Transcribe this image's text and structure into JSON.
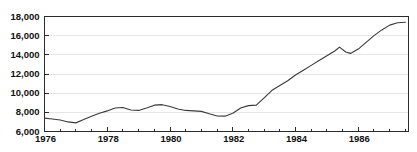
{
  "chart_data": {
    "type": "line",
    "title": "",
    "subtitle": "",
    "xlabel": "",
    "ylabel": "",
    "xlim": [
      1976,
      1987.6
    ],
    "ylim": [
      6000,
      18000
    ],
    "grid": true,
    "legend": null,
    "y_ticks": [
      6000,
      8000,
      10000,
      12000,
      14000,
      16000,
      18000
    ],
    "y_tick_labels": [
      "6,000",
      "8,000",
      "10,000",
      "12,000",
      "14,000",
      "16,000",
      "18,000"
    ],
    "x_ticks": [
      1976,
      1978,
      1980,
      1982,
      1984,
      1986
    ],
    "x_tick_labels": [
      "1976",
      "1978",
      "1980",
      "1982",
      "1984",
      "1986"
    ],
    "x_minor_tick_interval": 0.5,
    "line_color": "#3a3a3a",
    "grid_color": "#e6e6e6",
    "axis_color": "#2b2b2b",
    "series": [
      {
        "name": "series-1",
        "x": [
          1976.0,
          1976.25,
          1976.5,
          1976.75,
          1977.0,
          1977.25,
          1977.5,
          1977.75,
          1978.0,
          1978.25,
          1978.5,
          1978.75,
          1979.0,
          1979.25,
          1979.5,
          1979.75,
          1980.0,
          1980.25,
          1980.5,
          1980.75,
          1981.0,
          1981.25,
          1981.5,
          1981.75,
          1982.0,
          1982.25,
          1982.5,
          1982.75,
          1983.0,
          1983.25,
          1983.5,
          1983.75,
          1984.0,
          1984.25,
          1984.5,
          1984.75,
          1985.0,
          1985.25,
          1985.4,
          1985.6,
          1985.75,
          1986.0,
          1986.25,
          1986.5,
          1986.75,
          1987.0,
          1987.25,
          1987.5
        ],
        "values": [
          7400,
          7300,
          7200,
          7000,
          6900,
          7250,
          7600,
          7900,
          8150,
          8450,
          8500,
          8250,
          8200,
          8450,
          8750,
          8800,
          8600,
          8350,
          8200,
          8150,
          8100,
          7850,
          7620,
          7600,
          7900,
          8450,
          8700,
          8750,
          9500,
          10300,
          10800,
          11300,
          11900,
          12400,
          12900,
          13400,
          13900,
          14400,
          14800,
          14300,
          14150,
          14600,
          15300,
          16000,
          16600,
          17100,
          17350,
          17400
        ]
      }
    ]
  }
}
